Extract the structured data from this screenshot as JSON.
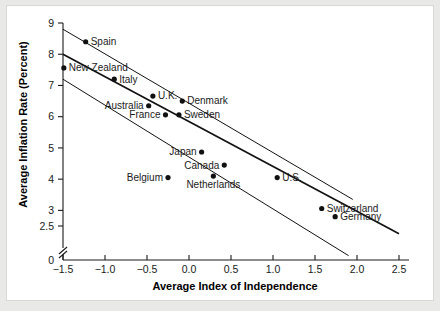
{
  "chart_data": {
    "type": "scatter",
    "title": "",
    "xlabel": "Average Index of Independence",
    "ylabel": "Average Inflation Rate (Percent)",
    "xlim": [
      -1.5,
      2.5
    ],
    "ylim": [
      2.5,
      9
    ],
    "xticks": [
      "-1.5",
      "-1.0",
      "-0.5",
      "0.0",
      "0.5",
      "1.0",
      "1.5",
      "2.0",
      "2.5"
    ],
    "xtick_values": [
      -1.5,
      -1.0,
      -0.5,
      0.0,
      0.5,
      1.0,
      1.5,
      2.0,
      2.5
    ],
    "yticks": [
      "9",
      "8",
      "7",
      "6",
      "5",
      "4",
      "3",
      "2.5",
      "0"
    ],
    "ytick_values": [
      9,
      8,
      7,
      6,
      5,
      4,
      3,
      2.5
    ],
    "y_axis_break": true,
    "y_zero_label": "0",
    "grid": false,
    "legend": "none",
    "points": [
      {
        "label": "Spain",
        "x": -1.23,
        "y": 8.4,
        "label_side": "right"
      },
      {
        "label": "New Zealand",
        "x": -1.49,
        "y": 7.56,
        "label_side": "right"
      },
      {
        "label": "Italy",
        "x": -0.89,
        "y": 7.2,
        "label_side": "right"
      },
      {
        "label": "U.K.",
        "x": -0.43,
        "y": 6.66,
        "label_side": "right"
      },
      {
        "label": "Denmark",
        "x": -0.08,
        "y": 6.5,
        "label_side": "right"
      },
      {
        "label": "Australia",
        "x": -0.48,
        "y": 6.35,
        "label_side": "left"
      },
      {
        "label": "Sweden",
        "x": -0.12,
        "y": 6.06,
        "label_side": "right"
      },
      {
        "label": "France",
        "x": -0.28,
        "y": 6.06,
        "label_side": "left"
      },
      {
        "label": "Japan",
        "x": 0.15,
        "y": 4.87,
        "label_side": "left"
      },
      {
        "label": "Canada",
        "x": 0.42,
        "y": 4.45,
        "label_side": "left"
      },
      {
        "label": "Netherlands",
        "x": 0.29,
        "y": 4.1,
        "label_side": "below"
      },
      {
        "label": "Belgium",
        "x": -0.25,
        "y": 4.05,
        "label_side": "left"
      },
      {
        "label": "U.S.",
        "x": 1.05,
        "y": 4.05,
        "label_side": "right"
      },
      {
        "label": "Switzerland",
        "x": 1.58,
        "y": 3.06,
        "label_side": "right"
      },
      {
        "label": "Germany",
        "x": 1.74,
        "y": 2.8,
        "label_side": "right"
      }
    ],
    "series": [
      {
        "name": "regression-line",
        "type": "line",
        "x": [
          -1.5,
          2.5
        ],
        "y": [
          8.0,
          2.25
        ]
      },
      {
        "name": "upper-confidence-band",
        "type": "line",
        "x": [
          -1.5,
          1.95
        ],
        "y": [
          8.8,
          3.35
        ]
      },
      {
        "name": "lower-confidence-band",
        "type": "line",
        "x": [
          -1.5,
          1.9
        ],
        "y": [
          7.2,
          1.55
        ]
      }
    ]
  }
}
